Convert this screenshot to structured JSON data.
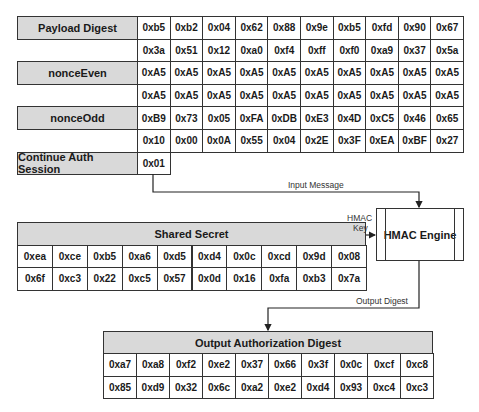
{
  "top_table": {
    "rows": [
      {
        "label": "Payload Digest",
        "values": [
          [
            "0xb5",
            "0xb2",
            "0x04",
            "0x62",
            "0x88",
            "0x9e",
            "0xb5",
            "0xfd",
            "0x90",
            "0x67"
          ],
          [
            "0x3a",
            "0x51",
            "0x12",
            "0xa0",
            "0xf4",
            "0xff",
            "0xf0",
            "0xa9",
            "0x37",
            "0x5a"
          ]
        ]
      },
      {
        "label": "nonceEven",
        "values": [
          [
            "0xA5",
            "0xA5",
            "0xA5",
            "0xA5",
            "0xA5",
            "0xA5",
            "0xA5",
            "0xA5",
            "0xA5",
            "0xA5"
          ],
          [
            "0xA5",
            "0xA5",
            "0xA5",
            "0xA5",
            "0xA5",
            "0xA5",
            "0xA5",
            "0xA5",
            "0xA5",
            "0xA5"
          ]
        ]
      },
      {
        "label": "nonceOdd",
        "values": [
          [
            "0xB9",
            "0x73",
            "0x05",
            "0xFA",
            "0xDB",
            "0xE3",
            "0x4D",
            "0xC5",
            "0x46",
            "0x65"
          ],
          [
            "0x10",
            "0x00",
            "0x0A",
            "0x55",
            "0x04",
            "0x2E",
            "0x3F",
            "0xEA",
            "0xBF",
            "0x27"
          ]
        ]
      },
      {
        "label": "Continue Auth Session",
        "values": [
          [
            "0x01"
          ]
        ]
      }
    ]
  },
  "arrows": {
    "input_message": "Input Message",
    "hmac_key_line1": "HMAC",
    "hmac_key_line2": "Key",
    "output_digest": "Output Digest"
  },
  "hmac_engine": {
    "label": "HMAC Engine"
  },
  "shared_secret": {
    "title": "Shared Secret",
    "rows": [
      [
        "0xea",
        "0xce",
        "0xb5",
        "0xa6",
        "0xd5",
        "0xd4",
        "0x0c",
        "0xcd",
        "0x9d",
        "0x08"
      ],
      [
        "0x6f",
        "0xc3",
        "0x22",
        "0xc5",
        "0x57",
        "0x0d",
        "0x16",
        "0xfa",
        "0xb3",
        "0x7a"
      ]
    ]
  },
  "output_digest": {
    "title": "Output Authorization Digest",
    "rows": [
      [
        "0xa7",
        "0xa8",
        "0xf2",
        "0xe2",
        "0x37",
        "0x66",
        "0x3f",
        "0x0c",
        "0xcf",
        "0xc8"
      ],
      [
        "0x85",
        "0xd9",
        "0x32",
        "0x6c",
        "0xa2",
        "0xe2",
        "0xd4",
        "0x93",
        "0xc4",
        "0xc3"
      ]
    ]
  },
  "colors": {
    "header_fill": "#d9d9d9",
    "border": "#333333",
    "cell_fill": "#ffffff"
  }
}
